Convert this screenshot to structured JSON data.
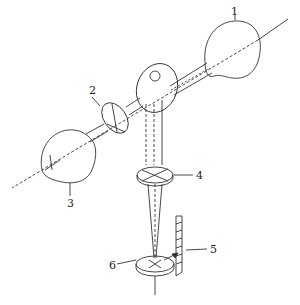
{
  "diagram": {
    "type": "optical-apparatus-schematic",
    "labels": [
      {
        "id": "1",
        "text": "1",
        "x": 231,
        "y": 6
      },
      {
        "id": "2",
        "text": "2",
        "x": 89,
        "y": 85
      },
      {
        "id": "3",
        "text": "3",
        "x": 68,
        "y": 201
      },
      {
        "id": "4",
        "text": "4",
        "x": 196,
        "y": 171
      },
      {
        "id": "5",
        "text": "5",
        "x": 210,
        "y": 247
      },
      {
        "id": "6",
        "text": "6",
        "x": 110,
        "y": 262
      }
    ],
    "colors": {
      "line": "#333333",
      "background": "#ffffff"
    }
  }
}
